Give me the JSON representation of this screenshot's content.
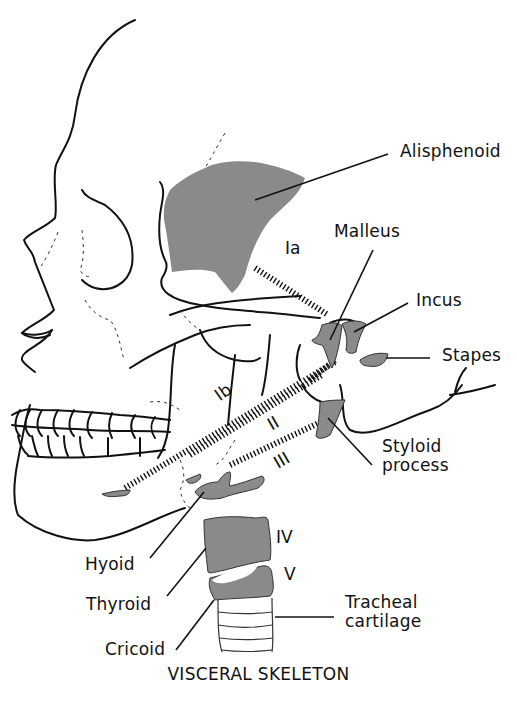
{
  "caption": "VISCERAL SKELETON",
  "colors": {
    "outline": "#111111",
    "bone_fill": "#8a8a8a",
    "background": "#ffffff"
  },
  "labels": {
    "alisphenoid": "Alisphenoid",
    "malleus": "Malleus",
    "incus": "Incus",
    "stapes": "Stapes",
    "styloid_1": "Styloid",
    "styloid_2": "process",
    "hyoid": "Hyoid",
    "thyroid": "Thyroid",
    "cricoid": "Cricoid",
    "tracheal_1": "Tracheal",
    "tracheal_2": "cartilage"
  },
  "arches": {
    "ia": "Ia",
    "ib": "Ib",
    "ii": "II",
    "iii": "III",
    "iv": "IV",
    "v": "V"
  }
}
